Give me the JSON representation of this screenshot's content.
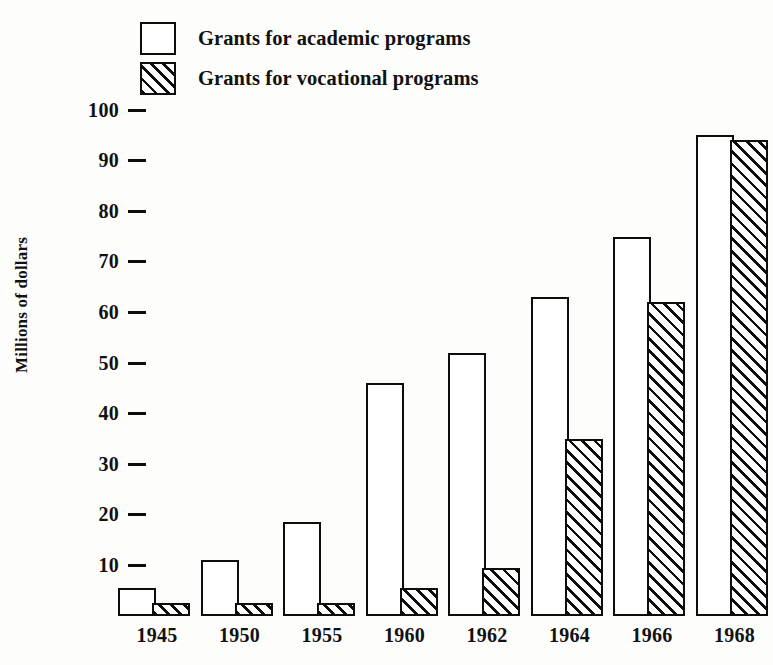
{
  "chart_data": {
    "type": "bar",
    "title": "",
    "xlabel": "",
    "ylabel": "Millions of dollars",
    "categories": [
      "1945",
      "1950",
      "1955",
      "1960",
      "1962",
      "1964",
      "1966",
      "1968"
    ],
    "series": [
      {
        "name": "Grants for academic programs",
        "pattern": "solid-outline",
        "values": [
          5.5,
          11,
          18.5,
          46,
          52,
          63,
          75,
          95
        ]
      },
      {
        "name": "Grants for vocational programs",
        "pattern": "diagonal-hatch",
        "values": [
          2.5,
          2.5,
          2.5,
          5.5,
          9.5,
          35,
          62,
          94
        ]
      }
    ],
    "ylim": [
      0,
      100
    ],
    "yticks": [
      100,
      90,
      80,
      70,
      60,
      50,
      40,
      30,
      20,
      10
    ],
    "ytick_labels": [
      "100",
      "90",
      "80",
      "70",
      "60",
      "50",
      "40",
      "30",
      "20",
      "10"
    ],
    "grid": false,
    "legend_position": "top-left",
    "colors": {
      "ink": "#0d0d0d",
      "background": "#fdfdfc",
      "bar_fill": "#ffffff"
    }
  },
  "legend": {
    "items": [
      {
        "label": "Grants for academic programs",
        "swatch": "open-square-swatch"
      },
      {
        "label": "Grants for vocational programs",
        "swatch": "hatched-square-swatch"
      }
    ]
  }
}
